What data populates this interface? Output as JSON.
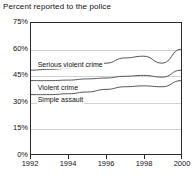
{
  "chart_data": {
    "type": "line",
    "title": "Percent reported to the police",
    "xlabel": "",
    "ylabel": "",
    "x": [
      1992,
      1993,
      1994,
      1995,
      1996,
      1997,
      1998,
      1999,
      2000
    ],
    "xlim": [
      1992,
      2000
    ],
    "ylim": [
      0,
      75
    ],
    "yticks": [
      0,
      15,
      30,
      45,
      60,
      75
    ],
    "ytick_labels": [
      "0%",
      "15%",
      "30%",
      "45%",
      "60%",
      "75%"
    ],
    "xticks": [
      1992,
      1994,
      1996,
      1998,
      2000
    ],
    "xtick_labels": [
      "1992",
      "1994",
      "1996",
      "1998",
      "2000"
    ],
    "grid": "horizontal",
    "legend": "inline-labels",
    "series": [
      {
        "name": "Serious violent crime",
        "values": [
          48.0,
          48.5,
          49.0,
          50.5,
          52.0,
          55.0,
          56.0,
          52.0,
          60.0
        ],
        "color": "#555555",
        "label_x": 1992.3,
        "label_y": 51.5
      },
      {
        "name": "Violent crime",
        "values": [
          42.0,
          42.0,
          42.3,
          43.0,
          43.5,
          44.5,
          45.0,
          44.0,
          48.0
        ],
        "color": "#555555",
        "label_x": 1992.3,
        "label_y": 38.5
      },
      {
        "name": "Simple assault",
        "values": [
          34.0,
          34.0,
          34.5,
          35.5,
          37.0,
          38.5,
          39.0,
          38.5,
          42.0
        ],
        "color": "#555555",
        "label_x": 1992.3,
        "label_y": 31.5
      }
    ]
  },
  "colors": {
    "line": "#555555",
    "grid": "#d2d2d2",
    "frame": "#2b2b2b",
    "text": "#111111",
    "background": "#ffffff"
  }
}
